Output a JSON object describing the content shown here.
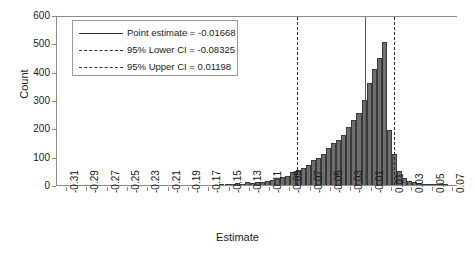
{
  "chart_data": {
    "type": "bar",
    "title": "",
    "xlabel": "Estimate",
    "ylabel": "Count",
    "xlim": [
      -0.32,
      0.075
    ],
    "ylim": [
      0,
      600
    ],
    "grid": false,
    "bin_width": 0.005,
    "xticks": [
      "-0.31",
      "-0.29",
      "-0.27",
      "-0.25",
      "-0.23",
      "-0.21",
      "-0.19",
      "-0.17",
      "-0.15",
      "-0.13",
      "-0.11",
      "-0.09",
      "-0.07",
      "-0.05",
      "-0.03",
      "-0.01",
      "0.01",
      "0.03",
      "0.05",
      "0.07"
    ],
    "xtick_values": [
      -0.31,
      -0.29,
      -0.27,
      -0.25,
      -0.23,
      -0.21,
      -0.19,
      -0.17,
      -0.15,
      -0.13,
      -0.11,
      -0.09,
      -0.07,
      -0.05,
      -0.03,
      -0.01,
      0.01,
      0.03,
      0.05,
      0.07
    ],
    "yticks": [
      "0",
      "100",
      "200",
      "300",
      "400",
      "500",
      "600"
    ],
    "ytick_values": [
      0,
      100,
      200,
      300,
      400,
      500,
      600
    ],
    "bin_centers": [
      -0.3075,
      -0.3025,
      -0.2975,
      -0.2925,
      -0.2875,
      -0.2825,
      -0.2775,
      -0.2725,
      -0.2675,
      -0.2625,
      -0.2575,
      -0.2525,
      -0.2475,
      -0.2425,
      -0.2375,
      -0.2325,
      -0.2275,
      -0.2225,
      -0.2175,
      -0.2125,
      -0.2075,
      -0.2025,
      -0.1975,
      -0.1925,
      -0.1875,
      -0.1825,
      -0.1775,
      -0.1725,
      -0.1675,
      -0.1625,
      -0.1575,
      -0.1525,
      -0.1475,
      -0.1425,
      -0.1375,
      -0.1325,
      -0.1275,
      -0.1225,
      -0.1175,
      -0.1125,
      -0.1075,
      -0.1025,
      -0.0975,
      -0.0925,
      -0.0875,
      -0.0825,
      -0.0775,
      -0.0725,
      -0.0675,
      -0.0625,
      -0.0575,
      -0.0525,
      -0.0475,
      -0.0425,
      -0.0375,
      -0.0325,
      -0.0275,
      -0.0225,
      -0.0175,
      -0.0125,
      -0.0075,
      -0.0025,
      0.0025,
      0.0075,
      0.0125,
      0.0175,
      0.0225,
      0.0275,
      0.0325,
      0.0375,
      0.0425,
      0.0475,
      0.0525,
      0.0575,
      0.0625
    ],
    "values": [
      0,
      0,
      0,
      0,
      0,
      0,
      0,
      0,
      0,
      0,
      0,
      0,
      0,
      0,
      0,
      0,
      0,
      0,
      0,
      0,
      0,
      0,
      0,
      0,
      0,
      0,
      0,
      0,
      0,
      0,
      2,
      4,
      3,
      6,
      5,
      9,
      8,
      12,
      10,
      14,
      18,
      22,
      28,
      33,
      45,
      52,
      60,
      72,
      88,
      95,
      110,
      130,
      150,
      160,
      178,
      205,
      230,
      255,
      300,
      360,
      410,
      450,
      505,
      195,
      110,
      48,
      26,
      14,
      10,
      7,
      5,
      4,
      3,
      2,
      1
    ],
    "reference_lines": [
      {
        "name": "point-estimate",
        "label": "Point estimate = -0.01668",
        "value": -0.01668,
        "style": "solid"
      },
      {
        "name": "lower-ci",
        "label": "95% Lower CI = -0.08325",
        "value": -0.08325,
        "style": "dashed"
      },
      {
        "name": "upper-ci",
        "label": "95% Upper CI = 0.01198",
        "value": 0.01198,
        "style": "dashed"
      }
    ],
    "legend_position": "top-left",
    "bar_color": "#6e6e6e",
    "bar_edge_color": "#3a3a3a"
  }
}
